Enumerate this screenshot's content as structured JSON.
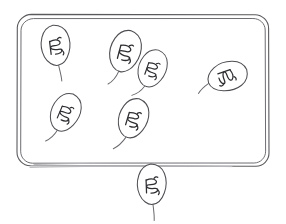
{
  "scene": {
    "title": "hand-drawn sketch of tagged leaf shapes inside a rounded frame",
    "width": 286,
    "height": 224,
    "background_color": "#ffffff",
    "stroke_color": "#4e4e53",
    "glyph_color": "#2e2e32",
    "faded_stroke_color": "#b7b7bb"
  },
  "frame": {
    "name": "rounded-rectangle-frame",
    "style": "double-line rounded rectangle, hand drawn, bottom edge faded",
    "x": 17,
    "y": 14,
    "width": 252,
    "height": 152,
    "corner_radius": 14,
    "line_count": 2,
    "label": ""
  },
  "tags": [
    {
      "id": "tag-1",
      "label": "",
      "glyph": "scribble-glyph",
      "center_x": 56,
      "center_y": 47,
      "rotation": -8,
      "scale": 1.0,
      "inside_frame": true,
      "stem_direction": "down"
    },
    {
      "id": "tag-2",
      "label": "",
      "glyph": "scribble-glyph",
      "center_x": 125,
      "center_y": 53,
      "rotation": 14,
      "scale": 1.05,
      "inside_frame": true,
      "stem_direction": "down"
    },
    {
      "id": "tag-3",
      "label": "",
      "glyph": "scribble-glyph",
      "center_x": 152,
      "center_y": 70,
      "rotation": 18,
      "scale": 0.95,
      "inside_frame": true,
      "stem_direction": "down"
    },
    {
      "id": "tag-4",
      "label": "",
      "glyph": "scribble-glyph",
      "center_x": 226,
      "center_y": 77,
      "rotation": 70,
      "scale": 1.0,
      "inside_frame": true,
      "stem_direction": "right"
    },
    {
      "id": "tag-5",
      "label": "",
      "glyph": "scribble-glyph",
      "center_x": 65,
      "center_y": 114,
      "rotation": 22,
      "scale": 0.98,
      "inside_frame": true,
      "stem_direction": "down"
    },
    {
      "id": "tag-6",
      "label": "",
      "glyph": "scribble-glyph",
      "center_x": 133,
      "center_y": 120,
      "rotation": 16,
      "scale": 1.0,
      "inside_frame": true,
      "stem_direction": "down"
    },
    {
      "id": "tag-7",
      "label": "",
      "glyph": "scribble-glyph",
      "center_x": 152,
      "center_y": 186,
      "rotation": -3,
      "scale": 1.0,
      "inside_frame": false,
      "stem_direction": "down"
    }
  ],
  "counts": {
    "tags_inside_frame": 6,
    "tags_outside_frame": 1,
    "tags_total": 7
  }
}
